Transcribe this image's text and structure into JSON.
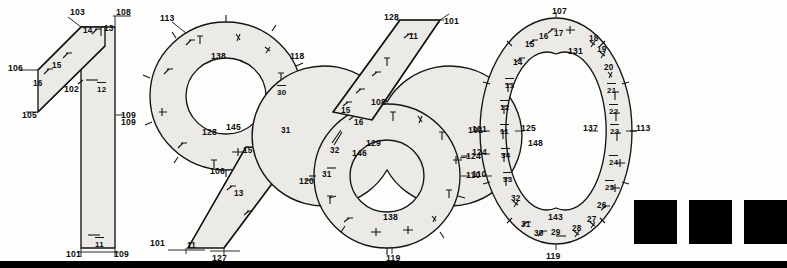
{
  "figure": {
    "title": "1960",
    "type": "technical-annotated-numerals",
    "background_color": "#fdfdfb",
    "line_color": "#141414",
    "band_fill_color": "#eceae6"
  },
  "digits": [
    {
      "glyph": "1",
      "name": "digit-one",
      "labels": [
        {
          "text": "103",
          "x": 70,
          "y": 8,
          "kind": "ref"
        },
        {
          "text": "108",
          "x": 116,
          "y": 8,
          "kind": "ref"
        },
        {
          "text": "14",
          "x": 83,
          "y": 27,
          "kind": "plain"
        },
        {
          "text": "13",
          "x": 104,
          "y": 25,
          "kind": "plain"
        },
        {
          "text": "15",
          "x": 52,
          "y": 62,
          "kind": "plain"
        },
        {
          "text": "16",
          "x": 33,
          "y": 80,
          "kind": "plain"
        },
        {
          "text": "106",
          "x": 8,
          "y": 64,
          "kind": "ref"
        },
        {
          "text": "105",
          "x": 22,
          "y": 111,
          "kind": "ref"
        },
        {
          "text": "102",
          "x": 64,
          "y": 85,
          "kind": "ref"
        },
        {
          "text": "12",
          "x": 97,
          "y": 82,
          "kind": "frac"
        },
        {
          "text": "109",
          "x": 121,
          "y": 111,
          "kind": "ref"
        },
        {
          "text": "11",
          "x": 95,
          "y": 237,
          "kind": "frac"
        },
        {
          "text": "101",
          "x": 66,
          "y": 250,
          "kind": "ref"
        },
        {
          "text": "109",
          "x": 114,
          "y": 250,
          "kind": "ref"
        }
      ]
    },
    {
      "glyph": "9",
      "name": "digit-nine",
      "labels": [
        {
          "text": "113",
          "x": 160,
          "y": 14,
          "kind": "ref"
        },
        {
          "text": "118",
          "x": 290,
          "y": 52,
          "kind": "ref"
        },
        {
          "text": "138",
          "x": 211,
          "y": 52,
          "kind": "ref"
        },
        {
          "text": "30",
          "x": 277,
          "y": 85,
          "kind": "frac"
        },
        {
          "text": "145",
          "x": 226,
          "y": 123,
          "kind": "ref"
        },
        {
          "text": "128",
          "x": 202,
          "y": 128,
          "kind": "ref"
        },
        {
          "text": "31",
          "x": 281,
          "y": 127,
          "kind": "plain"
        },
        {
          "text": "15",
          "x": 243,
          "y": 147,
          "kind": "plain"
        },
        {
          "text": "106",
          "x": 210,
          "y": 167,
          "kind": "ref"
        },
        {
          "text": "109",
          "x": 121,
          "y": 118,
          "kind": "ref"
        },
        {
          "text": "13",
          "x": 234,
          "y": 190,
          "kind": "plain"
        },
        {
          "text": "101",
          "x": 150,
          "y": 239,
          "kind": "ref"
        },
        {
          "text": "11",
          "x": 187,
          "y": 242,
          "kind": "plain"
        },
        {
          "text": "127",
          "x": 212,
          "y": 254,
          "kind": "ref"
        }
      ]
    },
    {
      "glyph": "6",
      "name": "digit-six",
      "labels": [
        {
          "text": "128",
          "x": 384,
          "y": 13,
          "kind": "ref"
        },
        {
          "text": "101",
          "x": 444,
          "y": 17,
          "kind": "ref"
        },
        {
          "text": "11",
          "x": 409,
          "y": 33,
          "kind": "plain"
        },
        {
          "text": "108",
          "x": 371,
          "y": 98,
          "kind": "ref"
        },
        {
          "text": "15",
          "x": 341,
          "y": 107,
          "kind": "plain"
        },
        {
          "text": "16",
          "x": 354,
          "y": 119,
          "kind": "plain"
        },
        {
          "text": "129",
          "x": 366,
          "y": 139,
          "kind": "ref"
        },
        {
          "text": "146",
          "x": 352,
          "y": 149,
          "kind": "ref"
        },
        {
          "text": "32",
          "x": 330,
          "y": 147,
          "kind": "plain"
        },
        {
          "text": "31",
          "x": 322,
          "y": 171,
          "kind": "plain"
        },
        {
          "text": "120",
          "x": 299,
          "y": 177,
          "kind": "ref"
        },
        {
          "text": "138",
          "x": 383,
          "y": 213,
          "kind": "ref"
        },
        {
          "text": "119",
          "x": 386,
          "y": 254,
          "kind": "ref"
        },
        {
          "text": "110",
          "x": 466,
          "y": 171,
          "kind": "ref"
        },
        {
          "text": "124",
          "x": 466,
          "y": 152,
          "kind": "ref"
        },
        {
          "text": "101",
          "x": 468,
          "y": 126,
          "kind": "ref"
        }
      ]
    },
    {
      "glyph": "0",
      "name": "digit-zero",
      "labels": [
        {
          "text": "107",
          "x": 552,
          "y": 7,
          "kind": "ref"
        },
        {
          "text": "131",
          "x": 568,
          "y": 47,
          "kind": "ref"
        },
        {
          "text": "16",
          "x": 539,
          "y": 33,
          "kind": "plain"
        },
        {
          "text": "17",
          "x": 554,
          "y": 30,
          "kind": "plain"
        },
        {
          "text": "18",
          "x": 589,
          "y": 35,
          "kind": "plain"
        },
        {
          "text": "19",
          "x": 597,
          "y": 46,
          "kind": "plain"
        },
        {
          "text": "15",
          "x": 525,
          "y": 41,
          "kind": "plain"
        },
        {
          "text": "20",
          "x": 604,
          "y": 64,
          "kind": "plain"
        },
        {
          "text": "14",
          "x": 513,
          "y": 59,
          "kind": "plain"
        },
        {
          "text": "21",
          "x": 607,
          "y": 83,
          "kind": "frac"
        },
        {
          "text": "13",
          "x": 505,
          "y": 78,
          "kind": "frac"
        },
        {
          "text": "22",
          "x": 609,
          "y": 104,
          "kind": "frac"
        },
        {
          "text": "12",
          "x": 500,
          "y": 100,
          "kind": "frac"
        },
        {
          "text": "101",
          "x": 472,
          "y": 125,
          "kind": "ref"
        },
        {
          "text": "11",
          "x": 500,
          "y": 124,
          "kind": "frac"
        },
        {
          "text": "125",
          "x": 521,
          "y": 124,
          "kind": "ref"
        },
        {
          "text": "137",
          "x": 583,
          "y": 124,
          "kind": "ref"
        },
        {
          "text": "23",
          "x": 610,
          "y": 124,
          "kind": "frac"
        },
        {
          "text": "113",
          "x": 636,
          "y": 124,
          "kind": "ref"
        },
        {
          "text": "148",
          "x": 528,
          "y": 139,
          "kind": "ref"
        },
        {
          "text": "124",
          "x": 472,
          "y": 148,
          "kind": "ref"
        },
        {
          "text": "34",
          "x": 501,
          "y": 148,
          "kind": "frac"
        },
        {
          "text": "24",
          "x": 609,
          "y": 155,
          "kind": "frac"
        },
        {
          "text": "110",
          "x": 472,
          "y": 170,
          "kind": "ref"
        },
        {
          "text": "33",
          "x": 503,
          "y": 172,
          "kind": "frac"
        },
        {
          "text": "25",
          "x": 605,
          "y": 180,
          "kind": "frac"
        },
        {
          "text": "32",
          "x": 511,
          "y": 195,
          "kind": "plain"
        },
        {
          "text": "26",
          "x": 597,
          "y": 202,
          "kind": "plain"
        },
        {
          "text": "27",
          "x": 587,
          "y": 216,
          "kind": "plain"
        },
        {
          "text": "143",
          "x": 548,
          "y": 213,
          "kind": "ref"
        },
        {
          "text": "31",
          "x": 521,
          "y": 221,
          "kind": "plain"
        },
        {
          "text": "28",
          "x": 572,
          "y": 225,
          "kind": "plain"
        },
        {
          "text": "29",
          "x": 551,
          "y": 229,
          "kind": "plain"
        },
        {
          "text": "30",
          "x": 534,
          "y": 230,
          "kind": "plain"
        },
        {
          "text": "119",
          "x": 546,
          "y": 252,
          "kind": "ref"
        }
      ]
    }
  ],
  "swatches": {
    "name": "black-square-swatches",
    "count": 3,
    "color": "#000000",
    "items": [
      {
        "x": 634,
        "y": 200,
        "w": 43,
        "h": 44
      },
      {
        "x": 689,
        "y": 200,
        "w": 43,
        "h": 44
      },
      {
        "x": 744,
        "y": 200,
        "w": 43,
        "h": 44
      }
    ]
  },
  "footer_bar": {
    "name": "bottom-black-bar",
    "color": "#000000",
    "x": 0,
    "y": 261,
    "w": 787,
    "h": 7
  }
}
